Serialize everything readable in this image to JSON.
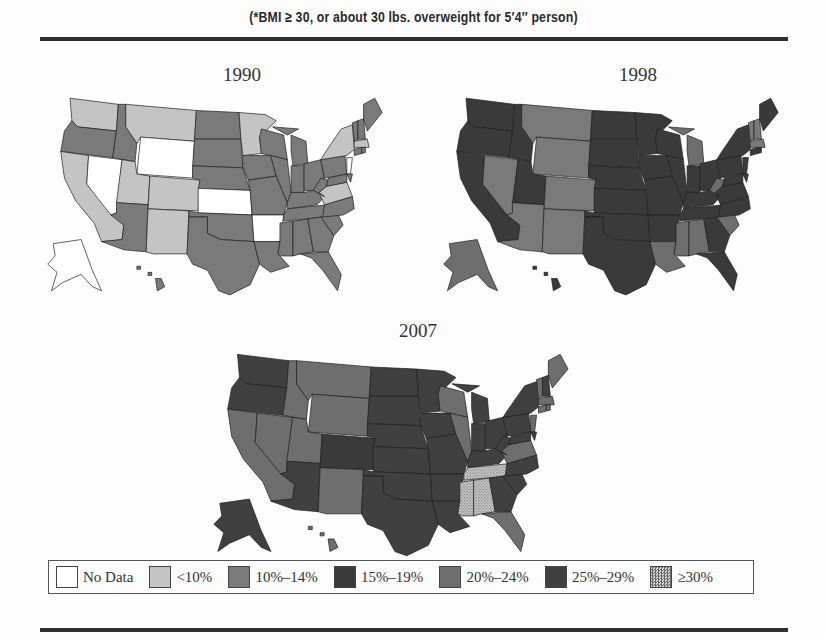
{
  "header": {
    "subtitle": "(*BMI ≥ 30, or about 30 lbs. overweight for 5′4′′ person)"
  },
  "legend": [
    {
      "label": "No Data",
      "color": "#ffffff",
      "pattern": "none"
    },
    {
      "label": "<10%",
      "color": "#c4c4c4",
      "pattern": "none"
    },
    {
      "label": "10%–14%",
      "color": "#7a7a7a",
      "pattern": "none"
    },
    {
      "label": "15%–19%",
      "color": "#3a3a3a",
      "pattern": "none"
    },
    {
      "label": "20%–24%",
      "color": "#6e6e6e",
      "pattern": "none"
    },
    {
      "label": "25%–29%",
      "color": "#404040",
      "pattern": "none"
    },
    {
      "label": "≥30%",
      "color": "#c8c8c8",
      "pattern": "dots"
    }
  ],
  "chart_data": [
    {
      "type": "choropleth",
      "title": "1990",
      "description": "Adult obesity prevalence by state",
      "categories": [
        "No Data",
        "<10%",
        "10%–14%",
        "15%–19%",
        "20%–24%",
        "25%–29%",
        "≥30%"
      ],
      "states": {
        "WA": "<10%",
        "OR": "10%–14%",
        "CA": "<10%",
        "NV": "No Data",
        "ID": "10%–14%",
        "MT": "<10%",
        "WY": "No Data",
        "UT": "<10%",
        "CO": "<10%",
        "AZ": "10%–14%",
        "NM": "<10%",
        "ND": "10%–14%",
        "SD": "10%–14%",
        "NE": "10%–14%",
        "KS": "No Data",
        "OK": "10%–14%",
        "TX": "10%–14%",
        "MN": "<10%",
        "IA": "10%–14%",
        "MO": "10%–14%",
        "AR": "No Data",
        "LA": "10%–14%",
        "WI": "10%–14%",
        "IL": "10%–14%",
        "MI": "10%–14%",
        "IN": "10%–14%",
        "OH": "10%–14%",
        "KY": "10%–14%",
        "TN": "10%–14%",
        "MS": "10%–14%",
        "AL": "10%–14%",
        "GA": "10%–14%",
        "FL": "10%–14%",
        "SC": "10%–14%",
        "NC": "10%–14%",
        "VA": "<10%",
        "WV": "10%–14%",
        "PA": "10%–14%",
        "NY": "<10%",
        "NJ": "No Data",
        "DE": "10%–14%",
        "MD": "10%–14%",
        "CT": "10%–14%",
        "RI": "10%–14%",
        "MA": "<10%",
        "VT": "10%–14%",
        "NH": "10%–14%",
        "ME": "10%–14%",
        "AK": "No Data",
        "HI": "10%–14%"
      }
    },
    {
      "type": "choropleth",
      "title": "1998",
      "description": "Adult obesity prevalence by state",
      "categories": [
        "No Data",
        "<10%",
        "10%–14%",
        "15%–19%",
        "20%–24%",
        "25%–29%",
        "≥30%"
      ],
      "states": {
        "WA": "15%–19%",
        "OR": "15%–19%",
        "CA": "15%–19%",
        "NV": "10%–14%",
        "ID": "15%–19%",
        "MT": "10%–14%",
        "WY": "10%–14%",
        "UT": "15%–19%",
        "CO": "10%–14%",
        "AZ": "10%–14%",
        "NM": "10%–14%",
        "ND": "15%–19%",
        "SD": "15%–19%",
        "NE": "15%–19%",
        "KS": "15%–19%",
        "OK": "15%–19%",
        "TX": "15%–19%",
        "MN": "15%–19%",
        "IA": "15%–19%",
        "MO": "15%–19%",
        "AR": "15%–19%",
        "LA": "20%–24%",
        "WI": "15%–19%",
        "IL": "15%–19%",
        "MI": "20%–24%",
        "IN": "15%–19%",
        "OH": "15%–19%",
        "KY": "15%–19%",
        "TN": "15%–19%",
        "MS": "20%–24%",
        "AL": "20%–24%",
        "GA": "15%–19%",
        "FL": "15%–19%",
        "SC": "20%–24%",
        "NC": "15%–19%",
        "VA": "15%–19%",
        "WV": "20%–24%",
        "PA": "15%–19%",
        "NY": "15%–19%",
        "NJ": "15%–19%",
        "DE": "15%–19%",
        "MD": "15%–19%",
        "CT": "15%–19%",
        "RI": "15%–19%",
        "MA": "10%–14%",
        "VT": "10%–14%",
        "NH": "10%–14%",
        "ME": "15%–19%",
        "AK": "20%–24%",
        "HI": "15%–19%"
      }
    },
    {
      "type": "choropleth",
      "title": "2007",
      "description": "Adult obesity prevalence by state",
      "categories": [
        "No Data",
        "<10%",
        "10%–14%",
        "15%–19%",
        "20%–24%",
        "25%–29%",
        "≥30%"
      ],
      "states": {
        "WA": "25%–29%",
        "OR": "25%–29%",
        "CA": "20%–24%",
        "NV": "20%–24%",
        "ID": "20%–24%",
        "MT": "20%–24%",
        "WY": "20%–24%",
        "UT": "20%–24%",
        "CO": "15%–19%",
        "AZ": "25%–29%",
        "NM": "20%–24%",
        "ND": "25%–29%",
        "SD": "25%–29%",
        "NE": "25%–29%",
        "KS": "25%–29%",
        "OK": "25%–29%",
        "TX": "25%–29%",
        "MN": "25%–29%",
        "IA": "25%–29%",
        "MO": "25%–29%",
        "AR": "25%–29%",
        "LA": "25%–29%",
        "WI": "20%–24%",
        "IL": "20%–24%",
        "MI": "25%–29%",
        "IN": "25%–29%",
        "OH": "25%–29%",
        "KY": "25%–29%",
        "TN": "≥30%",
        "MS": "≥30%",
        "AL": "≥30%",
        "GA": "25%–29%",
        "FL": "20%–24%",
        "SC": "25%–29%",
        "NC": "25%–29%",
        "VA": "20%–24%",
        "WV": "25%–29%",
        "PA": "25%–29%",
        "NY": "25%–29%",
        "NJ": "20%–24%",
        "DE": "25%–29%",
        "MD": "25%–29%",
        "CT": "20%–24%",
        "RI": "20%–24%",
        "MA": "20%–24%",
        "VT": "20%–24%",
        "NH": "25%–29%",
        "ME": "20%–24%",
        "AK": "25%–29%",
        "HI": "20%–24%"
      }
    }
  ],
  "maps": [
    {
      "title": "1990"
    },
    {
      "title": "1998"
    },
    {
      "title": "2007"
    }
  ]
}
